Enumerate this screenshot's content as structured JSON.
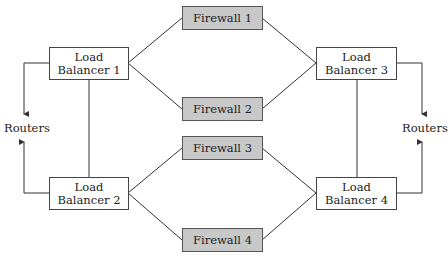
{
  "diagram": {
    "load_balancers": [
      {
        "line1": "Load",
        "line2": "Balancer 1"
      },
      {
        "line1": "Load",
        "line2": "Balancer 2"
      },
      {
        "line1": "Load",
        "line2": "Balancer 3"
      },
      {
        "line1": "Load",
        "line2": "Balancer 4"
      }
    ],
    "firewalls": [
      {
        "label": "Firewall 1"
      },
      {
        "label": "Firewall 2"
      },
      {
        "label": "Firewall 3"
      },
      {
        "label": "Firewall 4"
      }
    ],
    "routers_left": "Routers",
    "routers_right": "Routers",
    "colors": {
      "firewall_fill": "#c8c8c8",
      "load_balancer_fill": "#ffffff",
      "line": "#333333"
    }
  }
}
